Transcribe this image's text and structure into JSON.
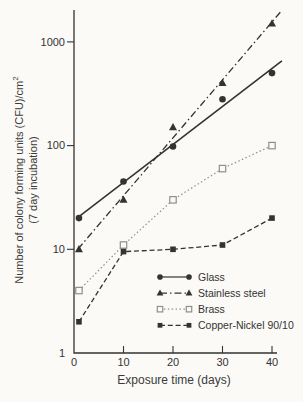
{
  "figure": {
    "background": "#fbfaf7",
    "ink": "#333333"
  },
  "chart_data": {
    "type": "line",
    "title": "",
    "xlabel": "Exposure time (days)",
    "ylabel_line1": "Number of colony forming units (CFU)/cm",
    "ylabel_sup": "2",
    "ylabel_line2": "(7 day incubation)",
    "x_scale": "linear",
    "y_scale": "log",
    "xlim": [
      0,
      42
    ],
    "ylim": [
      1,
      2200
    ],
    "x_ticks": [
      0,
      10,
      20,
      30,
      40
    ],
    "y_ticks": [
      1,
      10,
      100,
      1000
    ],
    "grid": false,
    "legend_position": "inside-bottom-right",
    "x": [
      1,
      10,
      20,
      30,
      40
    ],
    "series": [
      {
        "name": "Glass",
        "marker": "circle-filled",
        "line": "solid",
        "mode": "fit",
        "color": "#333333",
        "values": [
          20,
          45,
          98,
          280,
          500
        ]
      },
      {
        "name": "Stainless steel",
        "marker": "triangle-filled",
        "line": "dashdot",
        "mode": "fit",
        "color": "#333333",
        "values": [
          10,
          30,
          150,
          400,
          1500
        ]
      },
      {
        "name": "Brass",
        "marker": "square-open",
        "line": "dotted",
        "mode": "connect",
        "color": "#8f8f8f",
        "values": [
          4,
          11,
          30,
          60,
          100
        ]
      },
      {
        "name": "Copper-Nickel 90/10",
        "marker": "square-filled",
        "line": "dashed",
        "mode": "connect",
        "color": "#333333",
        "values": [
          2,
          9.5,
          10,
          11,
          20
        ]
      }
    ]
  }
}
